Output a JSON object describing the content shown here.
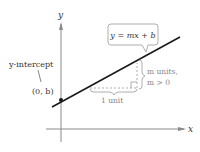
{
  "diagram": {
    "axes": {
      "x_label": "x",
      "y_label": "y"
    },
    "equation_label": "y = mx + b",
    "intercept": {
      "label": "y-intercept",
      "point": "(0, b)"
    },
    "rise": {
      "line1": "m units,",
      "line2": "m > 0"
    },
    "run": {
      "label": "1 unit"
    },
    "colors": {
      "line": "#1a1a1a",
      "axis": "#8a8a8a",
      "annotation": "#9a9a9a",
      "text": "#333333"
    }
  }
}
